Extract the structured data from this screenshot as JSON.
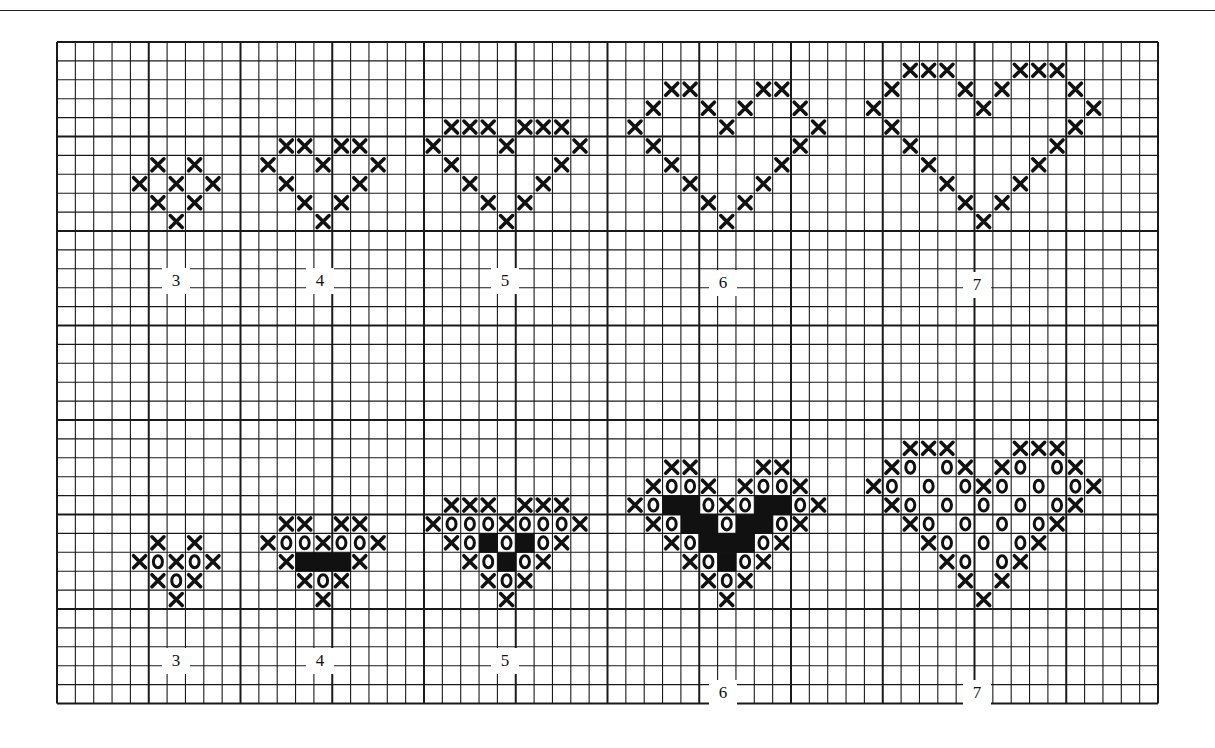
{
  "figure": {
    "colors": {
      "ink": "#111111",
      "grid": "#1a1a1a",
      "paper": "#ffffff"
    }
  },
  "grid": {
    "left": 57,
    "top": 42,
    "cell_w": 18.35,
    "cell_h": 18.9,
    "cols": 60,
    "rows": 35,
    "heavy_every": 5
  },
  "legend": {
    "x_symbol": "cross-stitch",
    "o_symbol": "circle-stitch",
    "fill_symbol": "solid-filled-square"
  },
  "labels": {
    "top": [
      "3",
      "4",
      "5",
      "6",
      "7"
    ],
    "bottom": [
      "3",
      "4",
      "5",
      "6",
      "7"
    ]
  },
  "label_positions": {
    "top": [
      [
        162,
        268
      ],
      [
        306,
        268
      ],
      [
        491,
        268
      ],
      [
        709,
        270
      ],
      [
        963,
        272
      ]
    ],
    "bottom": [
      [
        162,
        648
      ],
      [
        306,
        648
      ],
      [
        491,
        648
      ],
      [
        709,
        680
      ],
      [
        963,
        680
      ]
    ]
  },
  "hearts": [
    {
      "name": "top-heart-3",
      "col": 4,
      "row": 6,
      "pattern": [
        ".X.X.",
        "X.X.X",
        ".X.X.",
        "..X.."
      ]
    },
    {
      "name": "top-heart-4",
      "col": 11,
      "row": 5,
      "pattern": [
        ".XX.XX.",
        "X..X..X",
        ".X...X.",
        "..X.X..",
        "...X..."
      ]
    },
    {
      "name": "top-heart-5",
      "col": 20,
      "row": 4,
      "pattern": [
        ".XXX.XXX.",
        "X...X...X",
        ".X.....X.",
        "..X...X..",
        "...X.X...",
        "....X...."
      ]
    },
    {
      "name": "top-heart-6",
      "col": 31,
      "row": 2,
      "pattern": [
        "..XX...XX..",
        ".X..X.X..X.",
        "X....X....X",
        ".X.......X.",
        "..X.....X..",
        "...X...X...",
        "....X.X....",
        ".....X....."
      ]
    },
    {
      "name": "top-heart-7",
      "col": 44,
      "row": 1,
      "pattern": [
        "..XXX...XXX..",
        ".X...X.X...X.",
        "X.....X.....X",
        ".X.........X.",
        "..X.......X..",
        "...X.....X...",
        "....X...X....",
        ".....X.X.....",
        "......X......"
      ]
    },
    {
      "name": "bottom-heart-3",
      "col": 4,
      "row": 26,
      "pattern": [
        ".X.X.",
        "XOXOX",
        ".XOX.",
        "..X.."
      ]
    },
    {
      "name": "bottom-heart-4",
      "col": 11,
      "row": 25,
      "pattern": [
        ".XX.XX.",
        "XOOXOOX",
        ".X###X.",
        "..XOX..",
        "...X..."
      ]
    },
    {
      "name": "bottom-heart-5",
      "col": 20,
      "row": 24,
      "pattern": [
        ".XXX.XXX.",
        "XOOOXOOOX",
        ".XO#O#OX.",
        "..XO#OX..",
        "...XOX...",
        "....X...."
      ]
    },
    {
      "name": "bottom-heart-6",
      "col": 31,
      "row": 22,
      "pattern": [
        "..XX...XX..",
        ".XOOX.XOOX.",
        "XO##OXO##OX",
        ".XO##O##OX.",
        "..XO###OX..",
        "...XO#OX...",
        "....XOX....",
        ".....X....."
      ]
    },
    {
      "name": "bottom-heart-7",
      "col": 44,
      "row": 21,
      "pattern": [
        "..XXX...XXX..",
        ".XO.OX.XO.OX.",
        "XO.O.OXO.O.OX",
        ".XO.O.O.O.OX.",
        "..XO.O.O.OX..",
        "...XO.O.OX...",
        "....XO.OX....",
        ".....X.X.....",
        "......X......"
      ]
    }
  ]
}
